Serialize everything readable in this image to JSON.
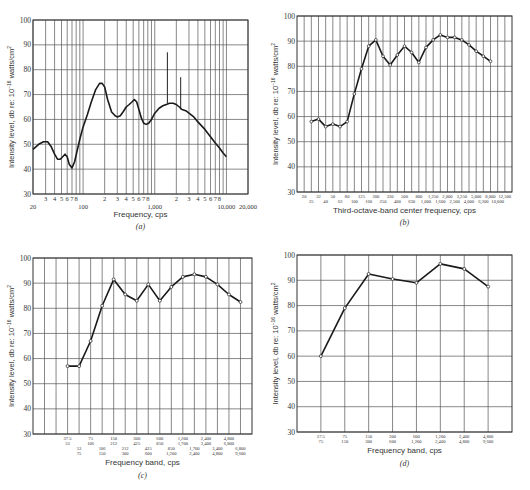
{
  "chart_data": [
    {
      "id": "a",
      "type": "line",
      "caption": "(a)",
      "xlabel": "Frequency, cps",
      "ylabel": "Intensity level, db re: 10^-16 watts/cm^2",
      "xscale": "log",
      "xlim": [
        20,
        20000
      ],
      "ylim": [
        30,
        100
      ],
      "yticks": [
        30,
        40,
        50,
        60,
        70,
        80,
        90,
        100
      ],
      "major_xtick_labels": [
        {
          "x": 20,
          "label": "20"
        },
        {
          "x": 100,
          "label": "100"
        },
        {
          "x": 1000,
          "label": "1,000"
        },
        {
          "x": 10000,
          "label": "10,000"
        },
        {
          "x": 20000,
          "label": "20,000"
        }
      ],
      "minor_xtick_labels": [
        "3",
        "4",
        "5",
        "6",
        "7",
        "8"
      ],
      "grid": true,
      "series": [
        {
          "name": "continuous spectrum",
          "x": [
            20,
            24,
            28,
            32,
            36,
            40,
            44,
            48,
            52,
            56,
            60,
            64,
            70,
            76,
            82,
            90,
            100,
            115,
            130,
            150,
            170,
            185,
            200,
            220,
            250,
            280,
            300,
            330,
            360,
            400,
            440,
            480,
            520,
            560,
            600,
            650,
            700,
            760,
            820,
            900,
            1000,
            1150,
            1300,
            1450,
            1600,
            1800,
            2000,
            2200,
            2400,
            2700,
            3000,
            3500,
            4000,
            5000,
            6000,
            7000,
            8000,
            9000,
            10000
          ],
          "y": [
            48,
            50,
            51,
            51,
            49,
            46,
            44,
            44,
            45,
            46,
            45,
            42,
            40.5,
            43,
            47,
            52,
            57,
            62,
            67,
            72,
            74.5,
            74.5,
            73,
            68,
            63,
            61.5,
            61,
            61.5,
            63,
            65,
            66,
            67,
            68,
            67,
            64,
            60.5,
            58.5,
            58,
            58.5,
            60,
            62.5,
            64.5,
            65.5,
            66,
            66.5,
            66.5,
            66,
            65,
            64,
            63.5,
            62.5,
            61,
            59,
            56,
            53,
            50.5,
            48.5,
            46.5,
            45
          ]
        }
      ],
      "spikes": [
        {
          "x": 1500,
          "y_base": 66.5,
          "y_peak": 87
        },
        {
          "x": 2300,
          "y_base": 64,
          "y_peak": 77
        }
      ]
    },
    {
      "id": "b",
      "type": "line",
      "caption": "(b)",
      "xlabel": "Third-octave-band center frequency, cps",
      "ylabel": "Intensity level, db re: 10^-16 watts/cm^2",
      "ylim": [
        30,
        100
      ],
      "yticks": [
        30,
        40,
        50,
        60,
        70,
        80,
        90,
        100
      ],
      "grid": true,
      "categories": [
        "20",
        "25",
        "32",
        "40",
        "50",
        "63",
        "80",
        "100",
        "125",
        "160",
        "200",
        "250",
        "320",
        "400",
        "500",
        "630",
        "800",
        "1,000",
        "1,250",
        "1,600",
        "2,000",
        "2,500",
        "3,250",
        "4,000",
        "5,000",
        "6,300",
        "8,000",
        "10,000",
        "12,500"
      ],
      "series": [
        {
          "name": "third-octave levels",
          "categories": [
            "25",
            "32",
            "40",
            "50",
            "63",
            "80",
            "100",
            "125",
            "160",
            "200",
            "250",
            "320",
            "400",
            "500",
            "630",
            "800",
            "1,000",
            "1,250",
            "1,600",
            "2,000",
            "2,500",
            "3,250",
            "4,000",
            "5,000",
            "6,300",
            "8,000"
          ],
          "values": [
            58,
            59,
            56,
            57,
            56,
            58,
            69,
            79,
            88,
            90.5,
            84,
            80.5,
            84.5,
            88,
            85.5,
            81.5,
            87.5,
            90.5,
            92.5,
            91.5,
            91.5,
            90.5,
            88.5,
            86,
            84,
            82
          ]
        }
      ]
    },
    {
      "id": "c",
      "type": "line",
      "caption": "(c)",
      "xlabel": "Frequency band, cps",
      "ylabel": "Intensity level, db re: 10^-16 watts/cm^2",
      "ylim": [
        30,
        100
      ],
      "yticks": [
        30,
        40,
        50,
        60,
        70,
        80,
        90,
        100
      ],
      "grid": true,
      "band_labels": [
        {
          "low": "37.5",
          "high": "53"
        },
        {
          "low": "53",
          "high": "75"
        },
        {
          "low": "75",
          "high": "106"
        },
        {
          "low": "106",
          "high": "150"
        },
        {
          "low": "150",
          "high": "212"
        },
        {
          "low": "212",
          "high": "300"
        },
        {
          "low": "300",
          "high": "425"
        },
        {
          "low": "425",
          "high": "600"
        },
        {
          "low": "600",
          "high": "850"
        },
        {
          "low": "850",
          "high": "1,200"
        },
        {
          "low": "1,200",
          "high": "1,700"
        },
        {
          "low": "1,700",
          "high": "2,400"
        },
        {
          "low": "2,400",
          "high": "3,400"
        },
        {
          "low": "3,400",
          "high": "4,800"
        },
        {
          "low": "4,800",
          "high": "6,800"
        },
        {
          "low": "6,800",
          "high": "9,600"
        }
      ],
      "series": [
        {
          "name": "half-octave levels",
          "values": [
            57,
            57,
            67,
            81,
            91.5,
            85.5,
            83,
            89.5,
            83,
            88.5,
            92.5,
            93.5,
            92.5,
            89.5,
            85.5,
            82.5
          ]
        }
      ]
    },
    {
      "id": "d",
      "type": "line",
      "caption": "(d)",
      "xlabel": "Frequency band, cps",
      "ylabel": "Intensity level, db re: 10^-16 watts/cm^2",
      "ylim": [
        30,
        100
      ],
      "yticks": [
        30,
        40,
        50,
        60,
        70,
        80,
        90,
        100
      ],
      "grid": true,
      "band_labels": [
        {
          "low": "37.5",
          "high": "75"
        },
        {
          "low": "75",
          "high": "150"
        },
        {
          "low": "150",
          "high": "300"
        },
        {
          "low": "300",
          "high": "600"
        },
        {
          "low": "600",
          "high": "1,200"
        },
        {
          "low": "1,200",
          "high": "2,400"
        },
        {
          "low": "2,400",
          "high": "4,800"
        },
        {
          "low": "4,800",
          "high": "9,600"
        }
      ],
      "series": [
        {
          "name": "octave levels",
          "values": [
            60,
            79,
            92.5,
            90.5,
            89,
            96.5,
            94.5,
            87.5
          ]
        }
      ]
    }
  ]
}
